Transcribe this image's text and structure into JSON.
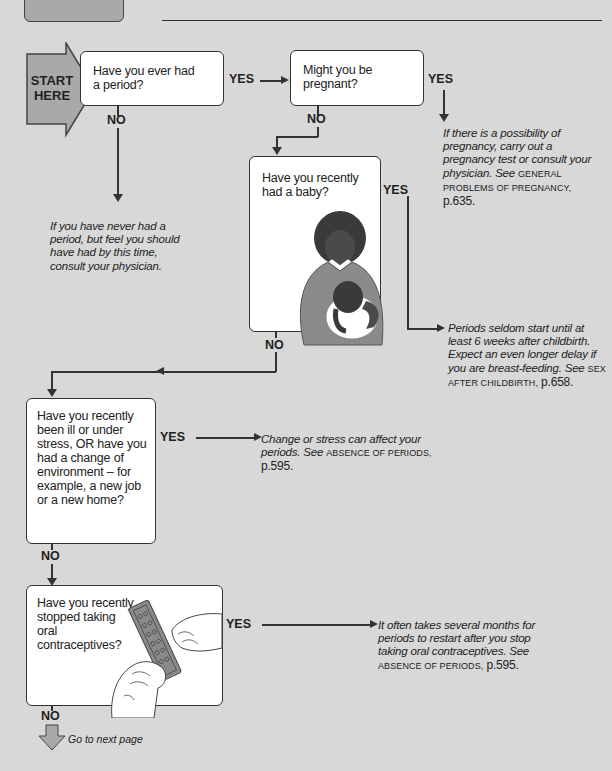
{
  "header": {
    "tab_box_color": "#a9a9a9"
  },
  "start": {
    "label_line1": "START",
    "label_line2": "HERE",
    "arrow_color": "#a9a9a9"
  },
  "questions": [
    {
      "id": "q1",
      "text": "Have you ever had a period?"
    },
    {
      "id": "q2",
      "text": "Might you be pregnant?"
    },
    {
      "id": "q3",
      "text": "Have you recently had a baby?"
    },
    {
      "id": "q4",
      "text": "Have you recently been ill or under stress, OR have you had a change of environment – for example, a new job or a new home?"
    },
    {
      "id": "q5",
      "text": "Have you recently stopped taking oral contraceptives?"
    }
  ],
  "labels": {
    "yes": "YES",
    "no": "NO"
  },
  "answers": {
    "q1_no": {
      "text": "If you have never had a period, but feel you should have had by this time, consult your physician."
    },
    "q2_yes": {
      "text": "If there is a possibility of pregnancy, carry out a pregnancy test or consult your physician.",
      "see": "See",
      "ref": "GENERAL PROBLEMS OF PREGNANCY,",
      "page": "p.635."
    },
    "q3_yes": {
      "text": "Periods seldom start until at least 6 weeks after childbirth. Expect an even longer delay if you are breast-feeding.",
      "see": "See",
      "ref": "SEX AFTER CHILDBIRTH,",
      "page": "p.658."
    },
    "q4_yes": {
      "text": "Change or stress can affect your periods.",
      "see": "See",
      "ref": "ABSENCE OF PERIODS,",
      "page": "p.595."
    },
    "q5_yes": {
      "text": "It often takes several months for periods to restart after you stop taking oral contraceptives.",
      "see": "See",
      "ref": "ABSENCE OF PERIODS,",
      "page": "p.595."
    }
  },
  "footer": {
    "next_page": "Go to next page"
  },
  "illustrations": {
    "q3": "mother-holding-baby",
    "q5": "hands-holding-pill-pack"
  }
}
